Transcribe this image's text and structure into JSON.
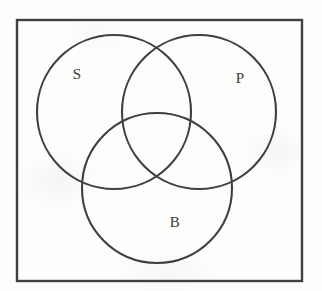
{
  "figure": {
    "kind": "venn-diagram",
    "background_color": "#fdfdfc",
    "stroke_color": "#3f3f3d",
    "label_color": "#4a4a48",
    "canvas": {
      "width": 322,
      "height": 291
    }
  },
  "universe_box": {
    "name": "universal-set-rectangle",
    "x": 17,
    "y": 20,
    "width": 285,
    "height": 261,
    "stroke_width": 2.4,
    "stroke_color": "#414140"
  },
  "circles": [
    {
      "id": "S",
      "label": "S",
      "name": "circle-s",
      "cx": 114,
      "cy": 112,
      "r": 77,
      "stroke_width": 2.1,
      "stroke_color": "#3f3f3d"
    },
    {
      "id": "P",
      "label": "P",
      "name": "circle-p",
      "cx": 199,
      "cy": 112,
      "r": 77,
      "stroke_width": 2.1,
      "stroke_color": "#3f3f3d"
    },
    {
      "id": "B",
      "label": "B",
      "name": "circle-b",
      "cx": 157,
      "cy": 188,
      "r": 75,
      "stroke_width": 2.1,
      "stroke_color": "#3f3f3d"
    }
  ],
  "labels": [
    {
      "id": "S",
      "text": "S",
      "x": 77,
      "y": 74,
      "font_size": 15
    },
    {
      "id": "P",
      "text": "P",
      "x": 240,
      "y": 78,
      "font_size": 15
    },
    {
      "id": "B",
      "text": "B",
      "x": 175,
      "y": 222,
      "font_size": 15
    }
  ]
}
